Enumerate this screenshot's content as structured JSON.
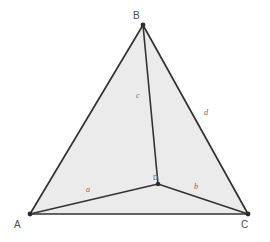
{
  "figure": {
    "background_color": "#ffffff",
    "fill_color": "#ebebeb",
    "stroke_color": "#333333",
    "label_color": "#4a4a4a",
    "segment_label_color": "#6a6a6a"
  },
  "vertices": {
    "A": {
      "label": "A",
      "x": 30,
      "y": 214,
      "label_x": 14,
      "label_y": 228
    },
    "B": {
      "label": "B",
      "x": 143,
      "y": 25,
      "label_x": 133,
      "label_y": 19
    },
    "C": {
      "label": "C",
      "x": 248,
      "y": 214,
      "label_x": 241,
      "label_y": 228
    },
    "D": {
      "label": "D",
      "x": 158,
      "y": 184,
      "label_x": 153,
      "label_y": 180
    }
  },
  "segments": {
    "a": {
      "label": "a",
      "from": "A",
      "to": "D",
      "label_x": 86,
      "label_y": 192
    },
    "b": {
      "label": "b",
      "from": "D",
      "to": "C",
      "label_x": 194,
      "label_y": 189
    },
    "c": {
      "label": "c",
      "from": "B",
      "to": "D",
      "label_x": 136,
      "label_y": 98
    },
    "d": {
      "label": "d",
      "from": "B",
      "to": "C",
      "label_x": 204,
      "label_y": 115
    }
  },
  "polygon": {
    "points": "30,214 143,25 248,214"
  }
}
